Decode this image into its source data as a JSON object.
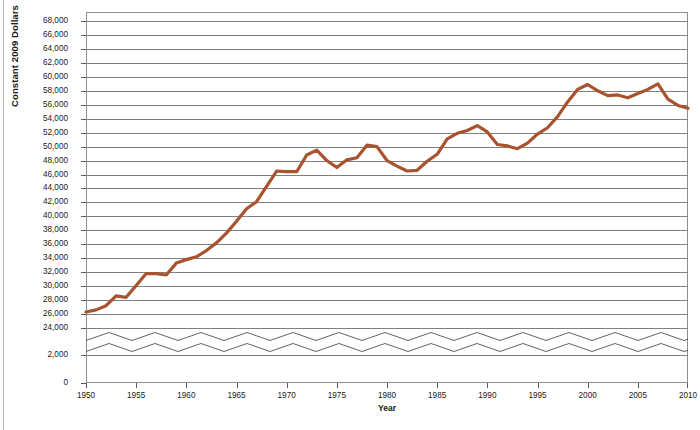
{
  "chart_data": {
    "type": "line",
    "title": "",
    "xlabel": "Year",
    "ylabel": "Constant 2009 Dollars",
    "xlim": [
      1950,
      2010
    ],
    "ylim": [
      0,
      68000
    ],
    "grid": true,
    "legend": "none",
    "axis_break": {
      "present": true,
      "note": "Value axis is broken between 2,000 and 24,000; band drawn with two thin zigzag rules",
      "below_break_ticks": [
        0,
        2000
      ],
      "above_break_start": 24000
    },
    "yticks": [
      "0",
      "2,000",
      "24,000",
      "26,000",
      "28,000",
      "30,000",
      "32,000",
      "34,000",
      "36,000",
      "38,000",
      "40,000",
      "42,000",
      "44,000",
      "46,000",
      "48,000",
      "50,000",
      "52,000",
      "54,000",
      "56,000",
      "58,000",
      "60,000",
      "62,000",
      "64,000",
      "66,000",
      "68,000"
    ],
    "ytick_values": [
      0,
      2000,
      24000,
      26000,
      28000,
      30000,
      32000,
      34000,
      36000,
      38000,
      40000,
      42000,
      44000,
      46000,
      48000,
      50000,
      52000,
      54000,
      56000,
      58000,
      60000,
      62000,
      64000,
      66000,
      68000
    ],
    "xticks": [
      "1950",
      "1955",
      "1960",
      "1965",
      "1970",
      "1975",
      "1980",
      "1985",
      "1990",
      "1995",
      "2000",
      "2005",
      "2010"
    ],
    "xtick_values": [
      1950,
      1955,
      1960,
      1965,
      1970,
      1975,
      1980,
      1985,
      1990,
      1995,
      2000,
      2005,
      2010
    ],
    "series": [
      {
        "name": "Median income (constant 2009 dollars)",
        "color": "#a8522e",
        "linewidth": 3.2,
        "x": [
          1950,
          1951,
          1952,
          1953,
          1954,
          1955,
          1956,
          1957,
          1958,
          1959,
          1960,
          1961,
          1962,
          1963,
          1964,
          1965,
          1966,
          1967,
          1968,
          1969,
          1970,
          1971,
          1972,
          1973,
          1974,
          1975,
          1976,
          1977,
          1978,
          1979,
          1980,
          1981,
          1982,
          1983,
          1984,
          1985,
          1986,
          1987,
          1988,
          1989,
          1990,
          1991,
          1992,
          1993,
          1994,
          1995,
          1996,
          1997,
          1998,
          1999,
          2000,
          2001,
          2002,
          2003,
          2004,
          2005,
          2006,
          2007,
          2008,
          2009,
          2010
        ],
        "values": [
          26300,
          26600,
          27200,
          28600,
          28400,
          30100,
          31800,
          31800,
          31600,
          33300,
          33800,
          34200,
          35100,
          36200,
          37600,
          39300,
          41100,
          42100,
          44300,
          46500,
          46400,
          46400,
          48800,
          49500,
          48000,
          47000,
          48100,
          48400,
          50200,
          50000,
          48000,
          47200,
          46500,
          46600,
          47900,
          48900,
          51100,
          51900,
          52300,
          53000,
          52100,
          50300,
          50100,
          49700,
          50500,
          51800,
          52700,
          54300,
          56400,
          58200,
          58900,
          58000,
          57300,
          57400,
          57000,
          57600,
          58200,
          59000,
          56800,
          55900,
          55500
        ],
        "notes": "Values read from the rust-brown trend line; broken axis compresses 0-24,000."
      }
    ]
  },
  "annotations": {
    "caption": ""
  }
}
